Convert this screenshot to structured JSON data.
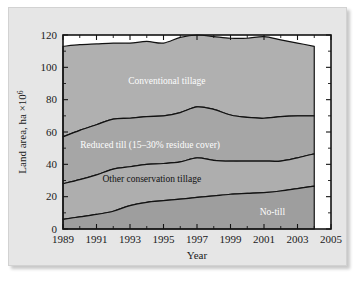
{
  "chart_data": {
    "type": "area",
    "stacked": true,
    "title": "",
    "subtitle": "",
    "xlabel": "Year",
    "ylabel": "Land area, ha ×10⁶",
    "ylabel_base": "Land area, ha ×10",
    "ylabel_exponent": "6",
    "xlim": [
      1989,
      2005
    ],
    "ylim": [
      0,
      120
    ],
    "grid": false,
    "legend_position": "inline-labels",
    "x": [
      1989,
      1990,
      1991,
      1992,
      1993,
      1994,
      1995,
      1996,
      1997,
      1998,
      1999,
      2000,
      2001,
      2002,
      2003,
      2004
    ],
    "x_major_ticks": [
      1989,
      1991,
      1993,
      1995,
      1997,
      1999,
      2001,
      2003,
      2005
    ],
    "x_major_tick_labels": [
      "1989",
      "1991",
      "1993",
      "1995",
      "1997",
      "1999",
      "2001",
      "2003",
      "2005"
    ],
    "x_minor_ticks": [
      1990,
      1992,
      1994,
      1996,
      1998,
      2000,
      2002,
      2004
    ],
    "y_major_ticks": [
      0,
      20,
      40,
      60,
      80,
      100,
      120
    ],
    "y_major_tick_labels": [
      "0",
      "20",
      "40",
      "60",
      "80",
      "100",
      "120"
    ],
    "y_minor_ticks": [
      10,
      30,
      50,
      70,
      90,
      110
    ],
    "series": [
      {
        "name": "No-till",
        "label": "No-till",
        "label_color": "#fdfdfd",
        "label_x": 2001.5,
        "label_y": 11,
        "fill": "#9e9e9e",
        "values": [
          6.0,
          7.5,
          9.0,
          11.0,
          14.5,
          16.5,
          17.5,
          18.5,
          19.5,
          20.5,
          21.5,
          22.0,
          22.5,
          23.5,
          25.0,
          26.5
        ]
      },
      {
        "name": "Other conservation tillage",
        "label": "Other conservation tillage",
        "label_color": "#121212",
        "label_x": 1994.3,
        "label_y": 31,
        "fill": "#aeaeae",
        "values": [
          22.0,
          23.0,
          24.5,
          26.0,
          24.0,
          23.5,
          23.0,
          23.0,
          24.5,
          22.0,
          20.5,
          20.0,
          19.5,
          18.5,
          19.0,
          20.0
        ]
      },
      {
        "name": "Reduced till (15–30% residue cover)",
        "label": "Reduced till (15–30% residue cover)",
        "label_color": "#fdfdfd",
        "label_x": 1994.2,
        "label_y": 52,
        "fill": "#a6a6a6",
        "values": [
          29.0,
          30.5,
          31.0,
          31.0,
          30.0,
          29.5,
          29.5,
          30.5,
          31.5,
          31.5,
          28.5,
          27.0,
          26.5,
          27.5,
          26.0,
          23.5
        ]
      },
      {
        "name": "Conventional tillage",
        "label": "Conventional tillage",
        "label_color": "#fdfdfd",
        "label_x": 1995.2,
        "label_y": 92,
        "fill": "#b0b0b0",
        "values": [
          56.0,
          53.0,
          50.0,
          47.0,
          46.5,
          46.5,
          45.0,
          46.5,
          44.5,
          45.0,
          47.5,
          49.0,
          50.5,
          47.5,
          45.0,
          43.0
        ]
      }
    ],
    "cumulative_totals": {
      "no_till": [
        6.0,
        7.5,
        9.0,
        11.0,
        14.5,
        16.5,
        17.5,
        18.5,
        19.5,
        20.5,
        21.5,
        22.0,
        22.5,
        23.5,
        25.0,
        26.5
      ],
      "plus_other_conservation": [
        28.0,
        30.5,
        33.5,
        37.0,
        38.5,
        40.0,
        40.5,
        41.5,
        44.0,
        42.5,
        42.0,
        42.0,
        42.0,
        42.0,
        44.0,
        46.5
      ],
      "plus_reduced_till": [
        57.0,
        61.0,
        64.5,
        68.0,
        68.5,
        69.5,
        70.0,
        72.0,
        75.5,
        74.0,
        70.5,
        69.0,
        68.5,
        69.5,
        70.0,
        70.0
      ],
      "total_all": [
        113.0,
        114.0,
        114.5,
        115.0,
        115.0,
        116.0,
        115.0,
        118.5,
        120.0,
        119.0,
        118.0,
        118.0,
        119.0,
        117.0,
        115.0,
        113.0
      ]
    }
  }
}
